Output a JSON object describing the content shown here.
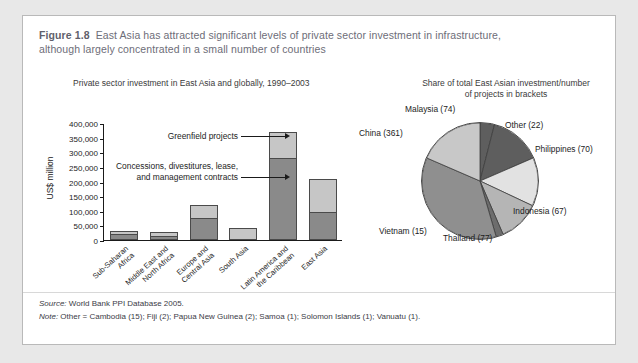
{
  "figure": {
    "number": "Figure 1.8",
    "title_line1": "East Asia has attracted significant levels of private sector investment in infrastructure,",
    "title_line2": "although largely concentrated in a small number of countries"
  },
  "footer": {
    "source_lead": "Source:",
    "source_text": " World Bank PPI Database 2005.",
    "note_lead": "Note:",
    "note_text": " Other = Cambodia (15); Fiji (2); Papua New Guinea (2); Samoa (1); Solomon Islands (1); Vanuatu (1)."
  },
  "colors": {
    "greenfield": "#c6c6c6",
    "concessions": "#8a8a8a",
    "outline": "#4a4a4a",
    "card_border": "#b9b9b9",
    "title_text": "#6d6d78"
  },
  "chart_data": [
    {
      "type": "bar",
      "title": "Private sector investment in East Asia and globally, 1990–2003",
      "xlabel": "",
      "ylabel": "US$ million",
      "ylim": [
        0,
        400000
      ],
      "yticks": [
        "0",
        "50,000",
        "100,000",
        "150,000",
        "200,000",
        "250,000",
        "300,000",
        "350,000",
        "400,000"
      ],
      "ytick_values": [
        0,
        50000,
        100000,
        150000,
        200000,
        250000,
        300000,
        350000,
        400000
      ],
      "grid": false,
      "legend": "annotations",
      "stacked": true,
      "categories": [
        "Sub-Saharan Africa",
        "Middle East and North Africa",
        "Europe and Central Asia",
        "South Asia",
        "Latin America and the Caribbean",
        "East Asia"
      ],
      "category_lines": [
        [
          "Sub-Saharan",
          "Africa"
        ],
        [
          "Middle East and",
          "North Africa"
        ],
        [
          "Europe and",
          "Central Asia"
        ],
        [
          "South Asia"
        ],
        [
          "Latin America and",
          "the Caribbean"
        ],
        [
          "East Asia"
        ]
      ],
      "series": [
        {
          "name": "Concessions, divestitures, lease, and management contracts",
          "values": [
            22000,
            15000,
            74000,
            0,
            280000,
            97000
          ]
        },
        {
          "name": "Greenfield projects",
          "values": [
            8000,
            13000,
            46000,
            42000,
            90000,
            110000
          ]
        }
      ],
      "annotations": [
        "Greenfield projects",
        "Concessions, divestitures, lease,",
        "and management contracts"
      ]
    },
    {
      "type": "pie",
      "title_line1": "Share of total East Asian investment/number",
      "title_line2": "of projects in brackets",
      "labels": [
        "Malaysia (74)",
        "Other (22)",
        "Philippines (70)",
        "Indonesia (67)",
        "Thailand (77)",
        "Vietnam (15)",
        "China (361)"
      ],
      "slices": [
        {
          "label": "Other (22)",
          "share": 4.0,
          "color": "#5e5e5e"
        },
        {
          "label": "Philippines (70)",
          "share": 14.5,
          "color": "#5e5e5e"
        },
        {
          "label": "Indonesia (67)",
          "share": 13.5,
          "color": "#e2e2e2"
        },
        {
          "label": "Thailand (77)",
          "share": 11.5,
          "color": "#b5b5b5"
        },
        {
          "label": "Vietnam (15)",
          "share": 2.0,
          "color": "#6d6d6d"
        },
        {
          "label": "China (361)",
          "share": 36.0,
          "color": "#8f8f8f"
        },
        {
          "label": "Malaysia (74)",
          "share": 18.5,
          "color": "#c8c8c8"
        }
      ]
    }
  ]
}
